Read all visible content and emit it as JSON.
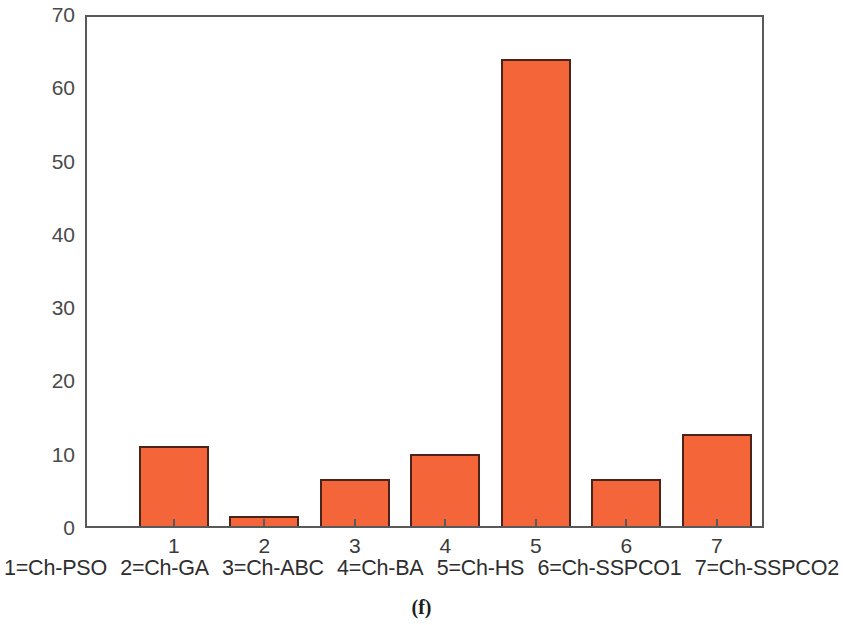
{
  "chart_data": {
    "type": "bar",
    "title": "",
    "subtitle": "",
    "xlabel": "",
    "ylabel": "",
    "categories": [
      "1",
      "2",
      "3",
      "4",
      "5",
      "6",
      "7"
    ],
    "values": [
      11.0,
      1.4,
      6.5,
      9.9,
      64.2,
      6.4,
      12.6
    ],
    "series": [
      {
        "name": "",
        "values": [
          11.0,
          1.4,
          6.5,
          9.9,
          64.2,
          6.4,
          12.6
        ]
      }
    ],
    "ylim": [
      0,
      70
    ],
    "ytick_labels": [
      "0",
      "10",
      "20",
      "30",
      "40",
      "50",
      "60",
      "70"
    ],
    "ytick_values": [
      0,
      10,
      20,
      30,
      40,
      50,
      60,
      70
    ],
    "xtick_labels": [
      "1",
      "2",
      "3",
      "4",
      "5",
      "6",
      "7"
    ],
    "grid": false,
    "legend_position": "below-axis",
    "legend_entries": [
      "1=Ch-PSO",
      "2=Ch-GA",
      "3=Ch-ABC",
      "4=Ch-BA",
      "5=Ch-HS",
      "6=Ch-SSPCO1",
      "7=Ch-SSPCO2"
    ],
    "annotations": [
      "(f)"
    ],
    "colors": {
      "bar_fill": "#F4663A",
      "bar_edge": "#4a2418",
      "axis": "#595959",
      "tick_text": "#4a4a4a",
      "background": "#ffffff"
    }
  },
  "caption": {
    "label": "(f)"
  }
}
